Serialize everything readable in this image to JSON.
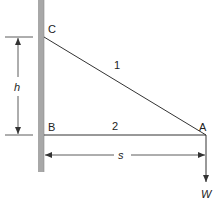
{
  "diagram": {
    "colors": {
      "wall": "#a8a8a8",
      "line": "#333333",
      "text": "#222222"
    },
    "points": {
      "C": {
        "label": "C"
      },
      "B": {
        "label": "B"
      },
      "A": {
        "label": "A"
      }
    },
    "members": [
      {
        "id": "1",
        "label": "1",
        "from": "C",
        "to": "A"
      },
      {
        "id": "2",
        "label": "2",
        "from": "B",
        "to": "A"
      }
    ],
    "dimensions": {
      "height": {
        "label": "h",
        "between": [
          "C",
          "B"
        ]
      },
      "span": {
        "label": "s",
        "between": [
          "wall",
          "A"
        ]
      }
    },
    "load": {
      "label": "W",
      "at": "A",
      "direction": "down"
    }
  }
}
